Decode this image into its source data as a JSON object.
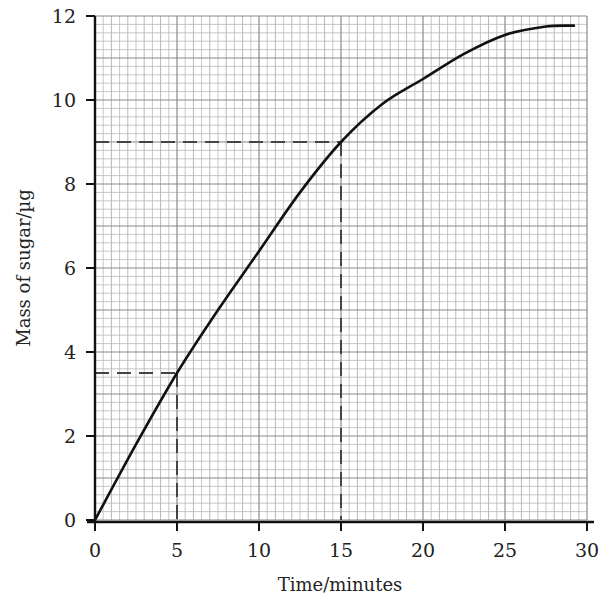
{
  "chart_data": {
    "type": "line",
    "title": "",
    "xlabel": "Time/minutes",
    "ylabel": "Mass of sugar/µg",
    "xlim": [
      0,
      30
    ],
    "ylim": [
      0,
      12
    ],
    "x_ticks": [
      0,
      5,
      10,
      15,
      20,
      25,
      30
    ],
    "y_ticks": [
      0,
      2,
      4,
      6,
      8,
      10,
      12
    ],
    "x_tick_labels": [
      "0",
      "5",
      "10",
      "15",
      "20",
      "25",
      "30"
    ],
    "y_tick_labels": [
      "0",
      "2",
      "4",
      "6",
      "8",
      "10",
      "12"
    ],
    "grid": true,
    "grid_minor_x_step": 0.5,
    "grid_minor_y_step": 0.2,
    "legend": null,
    "series": [
      {
        "name": "Mass of sugar",
        "color": "#111111",
        "x": [
          0,
          2.5,
          5,
          7.5,
          10,
          12.5,
          15,
          17.5,
          20,
          22.5,
          25,
          27.5,
          29.2
        ],
        "y": [
          0,
          1.8,
          3.5,
          5.0,
          6.4,
          7.8,
          9.0,
          9.9,
          10.5,
          11.1,
          11.55,
          11.75,
          11.77
        ]
      }
    ],
    "annotations": [
      {
        "type": "dashed-guide",
        "x": 5,
        "y": 3.5
      },
      {
        "type": "dashed-guide",
        "x": 15,
        "y": 9
      }
    ]
  }
}
